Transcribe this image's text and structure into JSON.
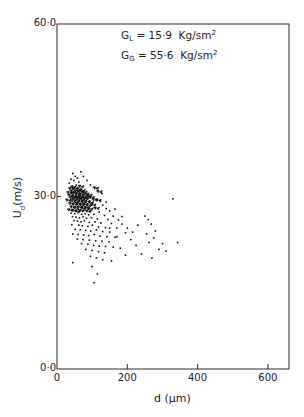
{
  "chart_data": {
    "type": "scatter",
    "title": "",
    "xlabel": "d (µm)",
    "ylabel": "U_d (m/s)",
    "xlim": [
      0,
      660
    ],
    "ylim": [
      0,
      60
    ],
    "xticks": [
      0,
      200,
      400,
      600
    ],
    "xtick_labels": [
      "0",
      "200",
      "400",
      "600"
    ],
    "yticks": [
      0,
      30,
      60
    ],
    "ytick_labels": [
      "0·0",
      "30·0",
      "60·0"
    ],
    "grid": false,
    "legend": null,
    "annotations": [
      {
        "text": "G_L = 15·9 Kg/sm²",
        "subscript": "L",
        "value": "15·9",
        "unit": "Kg/sm",
        "sup": "2"
      },
      {
        "text": "G_G = 55·6 Kg/sm²",
        "subscript": "G",
        "value": "55·6",
        "unit": "Kg/sm",
        "sup": "2"
      }
    ],
    "series": [
      {
        "name": "droplets",
        "marker": "dot",
        "color": "#111111",
        "points": [
          [
            45,
            34.0
          ],
          [
            52,
            33.5
          ],
          [
            40,
            33.0
          ],
          [
            58,
            33.2
          ],
          [
            48,
            32.8
          ],
          [
            62,
            32.5
          ],
          [
            35,
            32.3
          ],
          [
            55,
            32.0
          ],
          [
            44,
            31.8
          ],
          [
            66,
            31.9
          ],
          [
            38,
            31.5
          ],
          [
            50,
            31.6
          ],
          [
            60,
            31.4
          ],
          [
            70,
            31.2
          ],
          [
            42,
            31.0
          ],
          [
            54,
            31.1
          ],
          [
            64,
            31.0
          ],
          [
            75,
            30.9
          ],
          [
            33,
            30.8
          ],
          [
            47,
            30.7
          ],
          [
            57,
            30.6
          ],
          [
            68,
            30.5
          ],
          [
            80,
            30.6
          ],
          [
            90,
            30.4
          ],
          [
            36,
            30.3
          ],
          [
            46,
            30.2
          ],
          [
            56,
            30.1
          ],
          [
            66,
            30.2
          ],
          [
            76,
            30.0
          ],
          [
            86,
            30.1
          ],
          [
            96,
            30.0
          ],
          [
            40,
            29.9
          ],
          [
            50,
            29.8
          ],
          [
            60,
            29.9
          ],
          [
            70,
            29.7
          ],
          [
            80,
            29.8
          ],
          [
            105,
            29.6
          ],
          [
            115,
            29.5
          ],
          [
            30,
            29.5
          ],
          [
            44,
            29.4
          ],
          [
            54,
            29.3
          ],
          [
            64,
            29.4
          ],
          [
            74,
            29.2
          ],
          [
            84,
            29.3
          ],
          [
            94,
            29.1
          ],
          [
            124,
            29.2
          ],
          [
            38,
            28.9
          ],
          [
            48,
            28.8
          ],
          [
            58,
            28.9
          ],
          [
            68,
            28.7
          ],
          [
            78,
            28.8
          ],
          [
            88,
            28.6
          ],
          [
            100,
            28.7
          ],
          [
            130,
            28.5
          ],
          [
            42,
            28.3
          ],
          [
            52,
            28.2
          ],
          [
            62,
            28.3
          ],
          [
            72,
            28.1
          ],
          [
            82,
            28.2
          ],
          [
            92,
            28.0
          ],
          [
            110,
            28.1
          ],
          [
            140,
            27.9
          ],
          [
            35,
            27.8
          ],
          [
            46,
            27.7
          ],
          [
            56,
            27.6
          ],
          [
            66,
            27.7
          ],
          [
            76,
            27.5
          ],
          [
            86,
            27.6
          ],
          [
            96,
            27.4
          ],
          [
            120,
            27.3
          ],
          [
            150,
            27.5
          ],
          [
            40,
            27.1
          ],
          [
            50,
            27.0
          ],
          [
            60,
            27.2
          ],
          [
            70,
            26.9
          ],
          [
            80,
            27.0
          ],
          [
            90,
            26.8
          ],
          [
            105,
            26.9
          ],
          [
            135,
            26.7
          ],
          [
            160,
            26.6
          ],
          [
            44,
            26.5
          ],
          [
            54,
            26.4
          ],
          [
            64,
            26.3
          ],
          [
            74,
            26.5
          ],
          [
            84,
            26.2
          ],
          [
            98,
            26.3
          ],
          [
            115,
            26.1
          ],
          [
            145,
            26.0
          ],
          [
            175,
            25.9
          ],
          [
            48,
            25.8
          ],
          [
            58,
            25.7
          ],
          [
            68,
            25.6
          ],
          [
            78,
            25.8
          ],
          [
            92,
            25.5
          ],
          [
            108,
            25.6
          ],
          [
            125,
            25.4
          ],
          [
            155,
            25.3
          ],
          [
            185,
            25.2
          ],
          [
            42,
            25.1
          ],
          [
            62,
            25.0
          ],
          [
            72,
            24.9
          ],
          [
            88,
            24.8
          ],
          [
            100,
            25.0
          ],
          [
            118,
            24.7
          ],
          [
            138,
            24.6
          ],
          [
            170,
            24.5
          ],
          [
            52,
            24.3
          ],
          [
            66,
            24.2
          ],
          [
            82,
            24.1
          ],
          [
            96,
            24.0
          ],
          [
            112,
            24.2
          ],
          [
            130,
            23.9
          ],
          [
            150,
            23.8
          ],
          [
            195,
            23.7
          ],
          [
            45,
            23.5
          ],
          [
            60,
            23.4
          ],
          [
            76,
            23.3
          ],
          [
            90,
            23.2
          ],
          [
            106,
            23.4
          ],
          [
            122,
            23.1
          ],
          [
            142,
            23.0
          ],
          [
            165,
            22.9
          ],
          [
            58,
            22.6
          ],
          [
            74,
            22.5
          ],
          [
            92,
            22.4
          ],
          [
            110,
            22.3
          ],
          [
            128,
            22.2
          ],
          [
            148,
            22.1
          ],
          [
            70,
            21.8
          ],
          [
            88,
            21.7
          ],
          [
            104,
            21.5
          ],
          [
            120,
            21.4
          ],
          [
            138,
            21.3
          ],
          [
            160,
            21.2
          ],
          [
            82,
            20.8
          ],
          [
            100,
            20.6
          ],
          [
            118,
            20.4
          ],
          [
            135,
            20.2
          ],
          [
            95,
            19.6
          ],
          [
            112,
            19.3
          ],
          [
            130,
            19.0
          ],
          [
            155,
            18.8
          ],
          [
            45,
            18.5
          ],
          [
            100,
            17.8
          ],
          [
            115,
            16.5
          ],
          [
            105,
            15.0
          ],
          [
            200,
            24.5
          ],
          [
            215,
            23.8
          ],
          [
            230,
            25.0
          ],
          [
            250,
            26.6
          ],
          [
            260,
            26.0
          ],
          [
            268,
            25.2
          ],
          [
            255,
            23.5
          ],
          [
            275,
            22.8
          ],
          [
            262,
            22.0
          ],
          [
            280,
            24.0
          ],
          [
            290,
            20.8
          ],
          [
            270,
            19.3
          ],
          [
            300,
            21.8
          ],
          [
            310,
            20.5
          ],
          [
            330,
            29.6
          ],
          [
            343,
            22.0
          ],
          [
            240,
            20.0
          ],
          [
            225,
            21.5
          ],
          [
            210,
            22.5
          ],
          [
            195,
            19.8
          ],
          [
            180,
            21.0
          ],
          [
            170,
            23.0
          ],
          [
            185,
            26.5
          ],
          [
            150,
            24.5
          ],
          [
            165,
            27.8
          ],
          [
            140,
            29.0
          ],
          [
            128,
            30.5
          ],
          [
            118,
            31.0
          ],
          [
            108,
            31.6
          ],
          [
            95,
            32.0
          ],
          [
            85,
            32.8
          ],
          [
            75,
            33.5
          ],
          [
            68,
            34.3
          ]
        ]
      }
    ]
  }
}
